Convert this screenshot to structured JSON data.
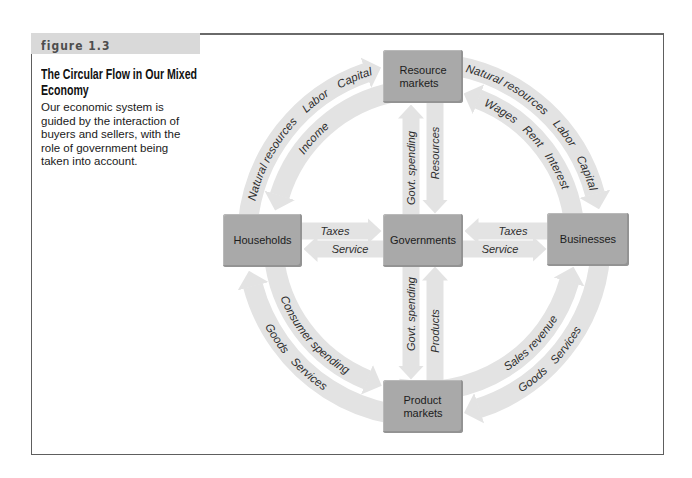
{
  "figure": {
    "number_label": "figure 1.3",
    "title": "The Circular Flow in Our Mixed Economy",
    "description": "Our economic system is guided by the interaction of buyers and sellers, with the role of government being taken into account."
  },
  "nodes": {
    "resource_markets": "Resource markets",
    "households": "Households",
    "governments": "Governments",
    "businesses": "Businesses",
    "product_markets": "Product markets"
  },
  "flows": {
    "households_to_resource_markets": [
      "Natural resources",
      "Labor",
      "Capital"
    ],
    "resource_markets_to_households": [
      "Income"
    ],
    "resource_markets_to_businesses": [
      "Natural resources",
      "Labor",
      "Capital"
    ],
    "businesses_to_resource_markets": [
      "Wages",
      "Rent",
      "Interest"
    ],
    "households_to_product_markets": [
      "Consumer spending"
    ],
    "product_markets_to_households": [
      "Goods",
      "Services"
    ],
    "product_markets_to_businesses": [
      "Sales revenue"
    ],
    "businesses_to_product_markets": [
      "Goods",
      "Services"
    ],
    "households_to_governments": [
      "Taxes"
    ],
    "governments_to_households": [
      "Service"
    ],
    "businesses_to_governments": [
      "Taxes"
    ],
    "governments_to_businesses": [
      "Service"
    ],
    "governments_to_resource_markets": [
      "Govt. spending"
    ],
    "resource_markets_to_governments": [
      "Resources"
    ],
    "governments_to_product_markets": [
      "Govt. spending"
    ],
    "product_markets_to_governments": [
      "Products"
    ]
  },
  "colors": {
    "box_fill": "#a9a9a9",
    "arrow_fill": "#e3e3e3",
    "header_band": "#d9d9d9",
    "frame": "#5e5e5e"
  }
}
